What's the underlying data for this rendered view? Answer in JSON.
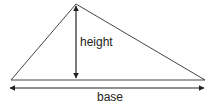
{
  "diagram": {
    "type": "triangle-area",
    "labels": {
      "height": "height",
      "base": "base"
    },
    "colors": {
      "stroke": "#222222",
      "background": "#ffffff"
    },
    "geometry": {
      "apex": [
        76,
        4
      ],
      "base_left": [
        11,
        80
      ],
      "base_right": [
        205,
        80
      ],
      "height_arrow": {
        "x": 76,
        "y1": 4,
        "y2": 80
      },
      "base_arrow": {
        "y": 88,
        "x1": 9,
        "x2": 205
      }
    }
  }
}
